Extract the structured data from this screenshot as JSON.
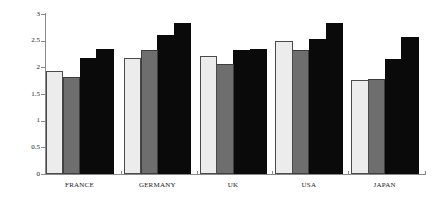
{
  "chart_data": {
    "type": "bar",
    "title": "",
    "subtitle": "",
    "xlabel": "",
    "ylabel": "",
    "ylim": [
      0,
      3
    ],
    "xlim": [
      0,
      5
    ],
    "grid": false,
    "legend": "none",
    "y_ticks": [
      "0",
      "0.5",
      "1",
      "1.5",
      "2",
      "2.5",
      "3"
    ],
    "y_tick_values": [
      0,
      0.5,
      1,
      1.5,
      2,
      2.5,
      3
    ],
    "categories": [
      "FRANCE",
      "GERMANY",
      "UK",
      "USA",
      "JAPAN"
    ],
    "series": [
      {
        "name": "series-1",
        "fill": "light",
        "color": "#ececec",
        "values": [
          1.94,
          2.18,
          2.21,
          2.5,
          1.76
        ]
      },
      {
        "name": "series-2",
        "fill": "gray",
        "color": "#6e6e6e",
        "values": [
          1.82,
          2.32,
          2.07,
          2.32,
          1.78
        ]
      },
      {
        "name": "series-3",
        "fill": "black",
        "color": "#0a0a0a",
        "values": [
          2.17,
          2.6,
          2.33,
          2.53,
          2.15
        ]
      },
      {
        "name": "series-4",
        "fill": "black",
        "color": "#0a0a0a",
        "values": [
          2.35,
          2.83,
          2.35,
          2.83,
          2.57
        ]
      }
    ]
  }
}
